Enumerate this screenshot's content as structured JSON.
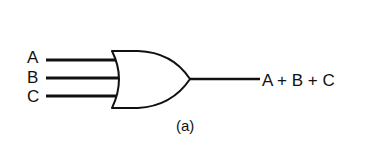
{
  "diagram": {
    "type": "logic-gate",
    "gate": "OR",
    "inputs": [
      {
        "label": "A"
      },
      {
        "label": "B"
      },
      {
        "label": "C"
      }
    ],
    "output": {
      "label": "A + B + C"
    },
    "caption": "(a)",
    "colors": {
      "stroke": "#111111",
      "background": "#ffffff"
    }
  }
}
